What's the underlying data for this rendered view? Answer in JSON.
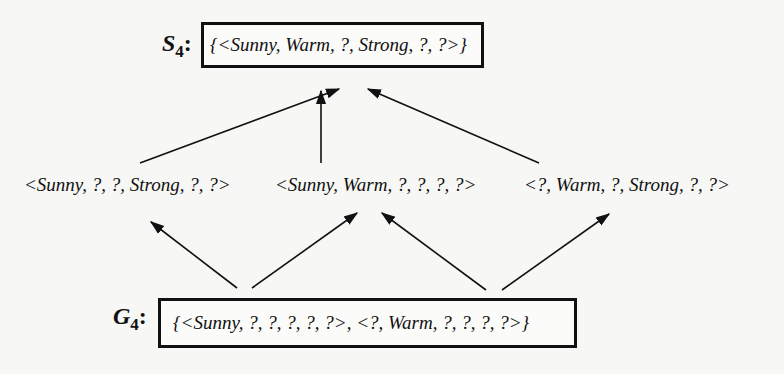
{
  "diagram": {
    "specific_boundary": {
      "label": "S",
      "subscript": "4",
      "colon": ":",
      "set": "{<Sunny, Warm, ?, Strong, ?, ?>}"
    },
    "middle_hypotheses": [
      "<Sunny, ?, ?, Strong, ?, ?>",
      "<Sunny, Warm, ?, ?, ?, ?>",
      "<?, Warm, ?, Strong, ?, ?>"
    ],
    "general_boundary": {
      "label": "G",
      "subscript": "4",
      "colon": ":",
      "set": "{<Sunny, ?, ?, ?, ?, ?>, <?, Warm, ?, ?, ?, ?>}"
    },
    "edges": [
      {
        "from": "middle_hypotheses.0",
        "to": "specific_boundary"
      },
      {
        "from": "middle_hypotheses.1",
        "to": "specific_boundary"
      },
      {
        "from": "middle_hypotheses.2",
        "to": "specific_boundary"
      },
      {
        "from": "general_boundary.0",
        "to": "middle_hypotheses.0"
      },
      {
        "from": "general_boundary.0",
        "to": "middle_hypotheses.1"
      },
      {
        "from": "general_boundary.1",
        "to": "middle_hypotheses.1"
      },
      {
        "from": "general_boundary.1",
        "to": "middle_hypotheses.2"
      }
    ]
  }
}
